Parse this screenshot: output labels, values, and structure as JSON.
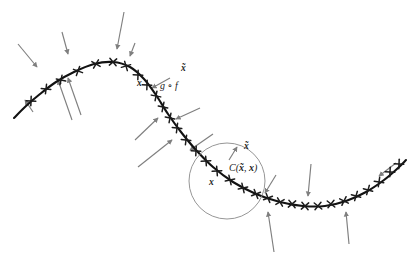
{
  "figure": {
    "background_color": "#ffffff",
    "manifold_color": "#121212",
    "vector_color": "#7f7f7f",
    "circle_color": "#8a8a8a",
    "tick_color": "#1c1c1c",
    "label_color": "#1a1a1a",
    "width": 413,
    "height": 270
  },
  "labels": {
    "x_upper": "x",
    "xtilde_upper": "x̃",
    "reconstruction_map": "g ∘ f",
    "x_lower": "x",
    "xtilde_lower": "x̃",
    "corruption_open": "C(",
    "corruption_xtilde": "x̃",
    "corruption_comma": ",",
    "corruption_x": "x",
    "corruption_close": ")"
  },
  "chart_data": {
    "type": "line",
    "xlabel": "",
    "ylabel": "",
    "xlim": [
      0,
      413
    ],
    "ylim": [
      0,
      270
    ],
    "grid": false,
    "legend": null,
    "series": [
      {
        "name": "manifold",
        "description": "S-shaped low-dimensional data manifold",
        "path_points": [
          [
            14,
            118
          ],
          [
            26,
            106
          ],
          [
            40,
            94
          ],
          [
            56,
            82
          ],
          [
            74,
            72
          ],
          [
            94,
            64
          ],
          [
            113,
            62
          ],
          [
            130,
            67
          ],
          [
            144,
            79
          ],
          [
            156,
            95
          ],
          [
            168,
            114
          ],
          [
            181,
            132
          ],
          [
            196,
            150
          ],
          [
            213,
            167
          ],
          [
            233,
            182
          ],
          [
            256,
            194
          ],
          [
            280,
            202
          ],
          [
            303,
            206
          ],
          [
            325,
            206
          ],
          [
            346,
            201
          ],
          [
            366,
            192
          ],
          [
            384,
            180
          ],
          [
            398,
            168
          ],
          [
            406,
            160
          ]
        ]
      }
    ],
    "data_points": {
      "name": "training examples (x marks on manifold)",
      "marker": "x",
      "points": [
        [
          31,
          101
        ],
        [
          46,
          89
        ],
        [
          61,
          80
        ],
        [
          78,
          71
        ],
        [
          96,
          64
        ],
        [
          113,
          62
        ],
        [
          126,
          66
        ],
        [
          138,
          75
        ],
        [
          147,
          85
        ],
        [
          156,
          96
        ],
        [
          163,
          107
        ],
        [
          170,
          118
        ],
        [
          177,
          128
        ],
        [
          186,
          140
        ],
        [
          196,
          151
        ],
        [
          206,
          161
        ],
        [
          217,
          171
        ],
        [
          230,
          180
        ],
        [
          243,
          188
        ],
        [
          256,
          194
        ],
        [
          268,
          198
        ],
        [
          280,
          202
        ],
        [
          292,
          204
        ],
        [
          305,
          206
        ],
        [
          318,
          206
        ],
        [
          331,
          204
        ],
        [
          344,
          201
        ],
        [
          356,
          196
        ],
        [
          368,
          190
        ],
        [
          379,
          182
        ],
        [
          390,
          172
        ],
        [
          399,
          164
        ]
      ]
    },
    "vectors": {
      "name": "reconstruction vector field g(f(x̃)) - x̃",
      "description": "gray arrows pointing from corrupted points back toward the manifold",
      "arrows": [
        {
          "tail": [
            18,
            44
          ],
          "head": [
            37,
            67
          ]
        },
        {
          "tail": [
            62,
            32
          ],
          "head": [
            68,
            54
          ]
        },
        {
          "tail": [
            124,
            12
          ],
          "head": [
            117,
            49
          ]
        },
        {
          "tail": [
            135,
            43
          ],
          "head": [
            130,
            56
          ]
        },
        {
          "tail": [
            33,
            112
          ],
          "head": [
            25,
            100
          ]
        },
        {
          "tail": [
            72,
            120
          ],
          "head": [
            58,
            80
          ]
        },
        {
          "tail": [
            81,
            115
          ],
          "head": [
            68,
            78
          ]
        },
        {
          "tail": [
            170,
            78
          ],
          "head": [
            152,
            88
          ]
        },
        {
          "tail": [
            135,
            140
          ],
          "head": [
            158,
            118
          ]
        },
        {
          "tail": [
            200,
            108
          ],
          "head": [
            176,
            119
          ]
        },
        {
          "tail": [
            138,
            167
          ],
          "head": [
            172,
            140
          ]
        },
        {
          "tail": [
            213,
            134
          ],
          "head": [
            190,
            150
          ]
        },
        {
          "tail": [
            229,
            160
          ],
          "head": [
            237,
            147
          ]
        },
        {
          "tail": [
            276,
            175
          ],
          "head": [
            265,
            193
          ]
        },
        {
          "tail": [
            274,
            252
          ],
          "head": [
            268,
            212
          ]
        },
        {
          "tail": [
            311,
            164
          ],
          "head": [
            308,
            196
          ]
        },
        {
          "tail": [
            349,
            244
          ],
          "head": [
            346,
            212
          ]
        },
        {
          "tail": [
            396,
            163
          ],
          "head": [
            379,
            176
          ]
        }
      ]
    },
    "annotations": [
      {
        "text": "x",
        "position": [
          137,
          83
        ],
        "bold": true,
        "italic": true
      },
      {
        "text": "x̃",
        "position": [
          183,
          68
        ],
        "bold": true,
        "italic": true
      },
      {
        "text": "g ∘ f",
        "position": [
          160,
          86
        ],
        "bold": false,
        "italic": true
      },
      {
        "text": "x",
        "position": [
          209,
          182
        ],
        "bold": true,
        "italic": true
      },
      {
        "text": "x̃",
        "position": [
          246,
          146
        ],
        "bold": true,
        "italic": true
      },
      {
        "text": "C(x̃, x)",
        "position": [
          229,
          168
        ],
        "bold": false,
        "italic": true
      }
    ],
    "shapes": [
      {
        "type": "circle",
        "name": "corruption-neighborhood",
        "center": [
          227,
          181
        ],
        "radius": 38,
        "stroke": "#8a8a8a",
        "fill": "none"
      }
    ]
  }
}
